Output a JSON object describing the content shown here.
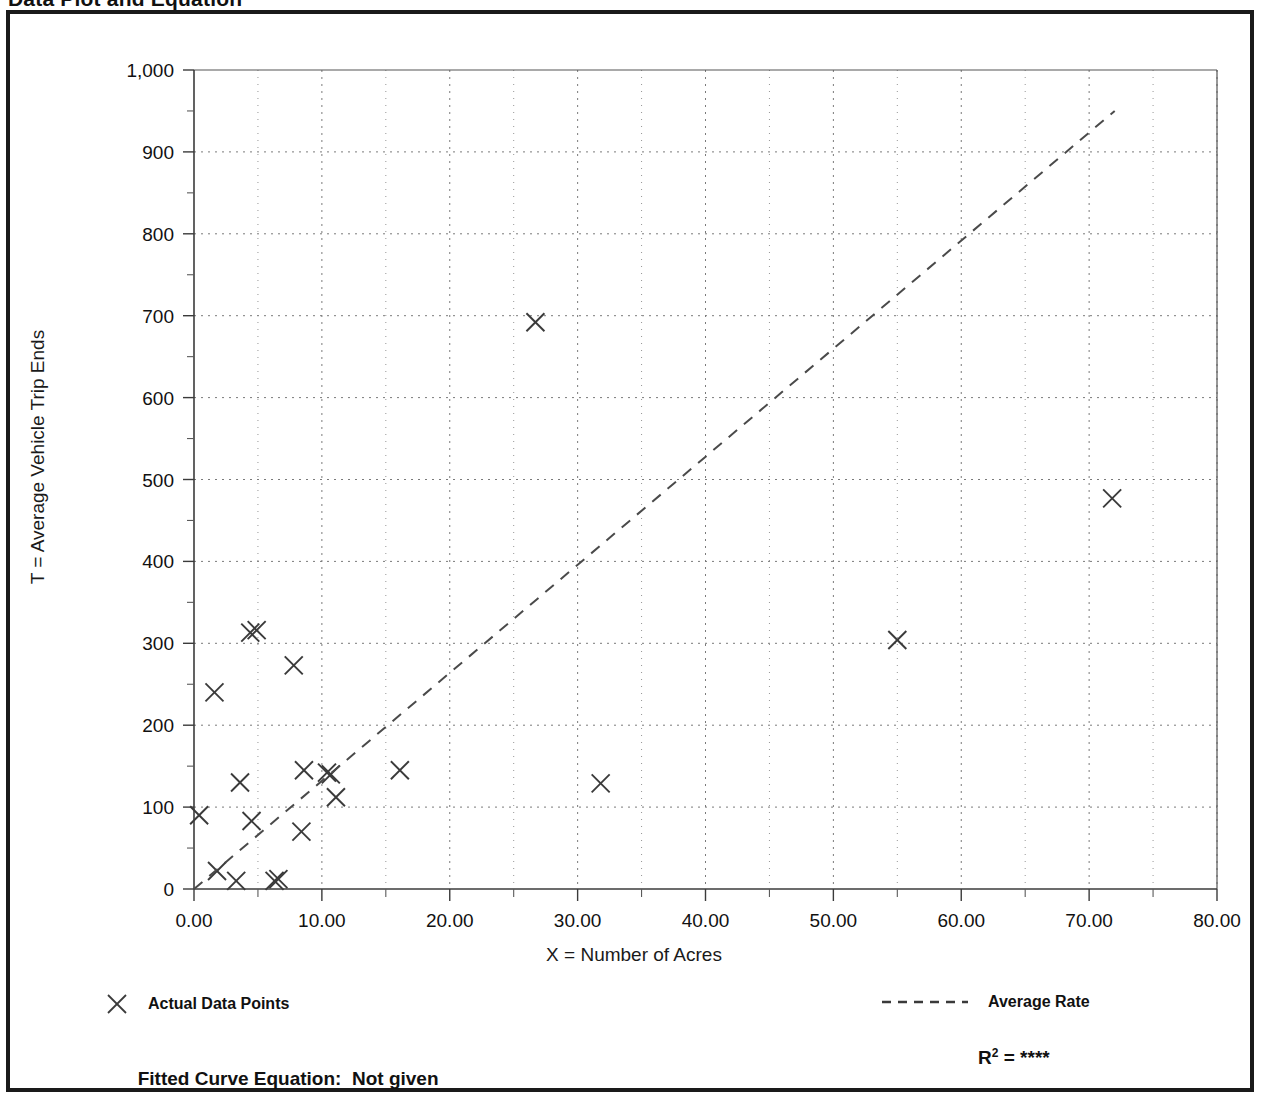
{
  "page": {
    "title": "Data Plot and Equation"
  },
  "chart_data": {
    "type": "scatter",
    "title": "Data Plot and Equation",
    "xlabel": "X = Number of Acres",
    "ylabel": "T = Average Vehicle Trip Ends",
    "xlim": [
      0,
      80
    ],
    "ylim": [
      0,
      1000
    ],
    "xticks": [
      "0.00",
      "10.00",
      "20.00",
      "30.00",
      "40.00",
      "50.00",
      "60.00",
      "70.00",
      "80.00"
    ],
    "xtick_values": [
      0,
      10,
      20,
      30,
      40,
      50,
      60,
      70,
      80
    ],
    "yticks": [
      "0",
      "100",
      "200",
      "300",
      "400",
      "500",
      "600",
      "700",
      "800",
      "900",
      "1,000"
    ],
    "ytick_values": [
      0,
      100,
      200,
      300,
      400,
      500,
      600,
      700,
      800,
      900,
      1000
    ],
    "x_minor_interval": 5,
    "y_minor_interval": 50,
    "grid": true,
    "grid_style": "dotted",
    "legend_position": "below-axes",
    "series": [
      {
        "name": "Actual Data Points",
        "type": "scatter",
        "marker": "x",
        "points": [
          [
            0.4,
            90
          ],
          [
            1.6,
            240
          ],
          [
            1.8,
            22
          ],
          [
            3.3,
            10
          ],
          [
            3.6,
            130
          ],
          [
            4.4,
            313
          ],
          [
            4.9,
            316
          ],
          [
            4.5,
            83
          ],
          [
            6.3,
            10
          ],
          [
            6.6,
            12
          ],
          [
            7.8,
            273
          ],
          [
            8.4,
            70
          ],
          [
            8.6,
            145
          ],
          [
            10.4,
            142
          ],
          [
            10.7,
            140
          ],
          [
            11.1,
            112
          ],
          [
            16.1,
            145
          ],
          [
            26.7,
            692
          ],
          [
            31.8,
            129
          ],
          [
            55.0,
            304
          ],
          [
            71.8,
            477
          ]
        ]
      },
      {
        "name": "Average Rate",
        "type": "line",
        "style": "dashed",
        "endpoints": [
          [
            0,
            0
          ],
          [
            72.0,
            950
          ]
        ]
      }
    ]
  },
  "legend": {
    "points_label": "Actual Data Points",
    "points_marker_icon": "x-marker-icon",
    "line_label": "Average Rate",
    "line_marker_icon": "dashed-line-icon"
  },
  "footer": {
    "fitted_equation_label": "Fitted Curve Equation:",
    "fitted_equation_value": "Not given",
    "r_squared_label": "R",
    "r_squared_exponent": "2",
    "r_squared_equals": "=",
    "r_squared_value": "****"
  },
  "colors": {
    "frame": "#1a1a1a",
    "axis": "#555555",
    "grid": "#7a7a7a",
    "marker": "#3a3a3a",
    "trend": "#4a4a4a",
    "text": "#111111"
  }
}
